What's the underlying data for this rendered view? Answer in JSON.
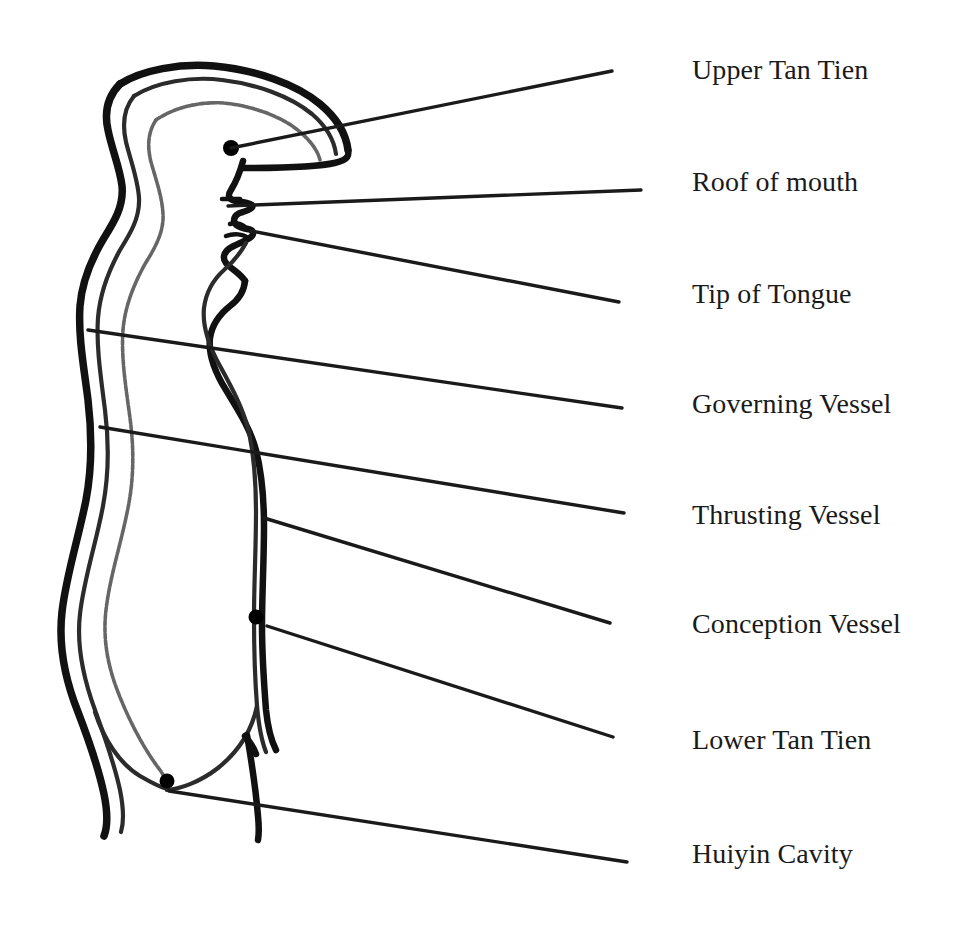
{
  "figure": {
    "background_color": "#ffffff",
    "ink_color": "#111111",
    "vessel_line_color": "#2b2b2b",
    "thrusting_line_color": "#555555",
    "leader_line_color": "#1a1a1a"
  },
  "labels": [
    {
      "id": "upper-tan-tien",
      "text": "Upper Tan Tien",
      "leader_start": {
        "x": 231,
        "y": 148
      },
      "leader_end": {
        "x": 612,
        "y": 71
      },
      "marker": {
        "x": 231,
        "y": 148,
        "r": 7
      }
    },
    {
      "id": "roof-of-mouth",
      "text": "Roof of mouth",
      "leader_start": {
        "x": 228,
        "y": 206
      },
      "leader_end": {
        "x": 641,
        "y": 190
      },
      "marker": null
    },
    {
      "id": "tip-of-tongue",
      "text": "Tip of Tongue",
      "leader_start": {
        "x": 251,
        "y": 231
      },
      "leader_end": {
        "x": 619,
        "y": 302
      },
      "marker": null
    },
    {
      "id": "governing-vessel",
      "text": "Governing Vessel",
      "leader_start": {
        "x": 88,
        "y": 330
      },
      "leader_end": {
        "x": 622,
        "y": 408
      },
      "marker": null
    },
    {
      "id": "thrusting-vessel",
      "text": "Thrusting Vessel",
      "leader_start": {
        "x": 100,
        "y": 427
      },
      "leader_end": {
        "x": 624,
        "y": 513
      },
      "marker": null
    },
    {
      "id": "conception-vessel",
      "text": "Conception Vessel",
      "leader_start": {
        "x": 264,
        "y": 518
      },
      "leader_end": {
        "x": 610,
        "y": 623
      },
      "marker": null
    },
    {
      "id": "lower-tan-tien",
      "text": "Lower Tan Tien",
      "leader_start": {
        "x": 267,
        "y": 626
      },
      "leader_end": {
        "x": 613,
        "y": 737
      },
      "marker": {
        "x": 256,
        "y": 617,
        "r": 7
      }
    },
    {
      "id": "huiyin-cavity",
      "text": "Huiyin Cavity",
      "leader_start": {
        "x": 169,
        "y": 791
      },
      "leader_end": {
        "x": 627,
        "y": 862
      },
      "marker": {
        "x": 167,
        "y": 781,
        "r": 7
      }
    }
  ]
}
